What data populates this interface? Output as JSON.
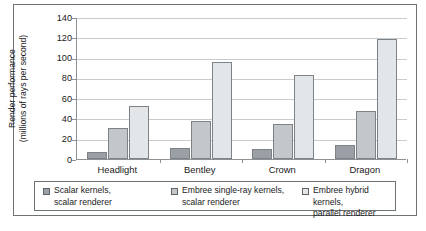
{
  "chart_data": {
    "type": "bar",
    "title": "",
    "xlabel": "",
    "ylabel": "Render performance\n(millions of rays per second)",
    "categories": [
      "Headlight",
      "Bentley",
      "Crown",
      "Dragon"
    ],
    "ylim": [
      0,
      140
    ],
    "yticks": [
      0,
      20,
      40,
      60,
      80,
      100,
      120,
      140
    ],
    "grid": true,
    "legend_position": "bottom",
    "series": [
      {
        "name": "Scalar kernels,\nscalar renderer",
        "color": "#9aa0a6",
        "values": [
          7,
          11,
          10,
          14
        ]
      },
      {
        "name": "Embree single-ray kernels,\nscalar renderer",
        "color": "#c3c7ca",
        "values": [
          31,
          37,
          35,
          47
        ]
      },
      {
        "name": "Embree hybrid kernels,\nparallel renderer",
        "color": "#e3e6e8",
        "values": [
          52,
          96,
          83,
          118
        ]
      }
    ]
  }
}
